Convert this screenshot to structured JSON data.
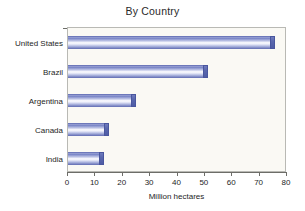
{
  "chart_data": {
    "type": "bar",
    "orientation": "horizontal",
    "title": "By Country",
    "xlabel": "Million hectares",
    "ylabel": "",
    "categories": [
      "United States",
      "Brazil",
      "Argentina",
      "Canada",
      "India"
    ],
    "values": [
      75.5,
      51,
      25,
      15,
      13
    ],
    "xlim": [
      0,
      80
    ],
    "xticks": [
      0,
      10,
      20,
      30,
      40,
      50,
      60,
      70,
      80
    ],
    "xtick_labels": [
      "0",
      "10",
      "20",
      "30",
      "40",
      "50",
      "60",
      "70",
      "80"
    ],
    "grid": false,
    "legend": null,
    "legend_position": "none",
    "series": [
      {
        "name": "Million hectares",
        "values": [
          75.5,
          51,
          25,
          15,
          13
        ]
      }
    ],
    "colors": {
      "bar_gradient_edge": "#7781c2",
      "bar_gradient_center": "#fbfbfe",
      "bar_end_cap": "#5a68ae",
      "plot_background": "#faf9f4",
      "plot_border": "#b9b9b4",
      "axis_line": "#6d6d68",
      "text": "#1e1e1e",
      "page_background": "#ffffff"
    }
  }
}
